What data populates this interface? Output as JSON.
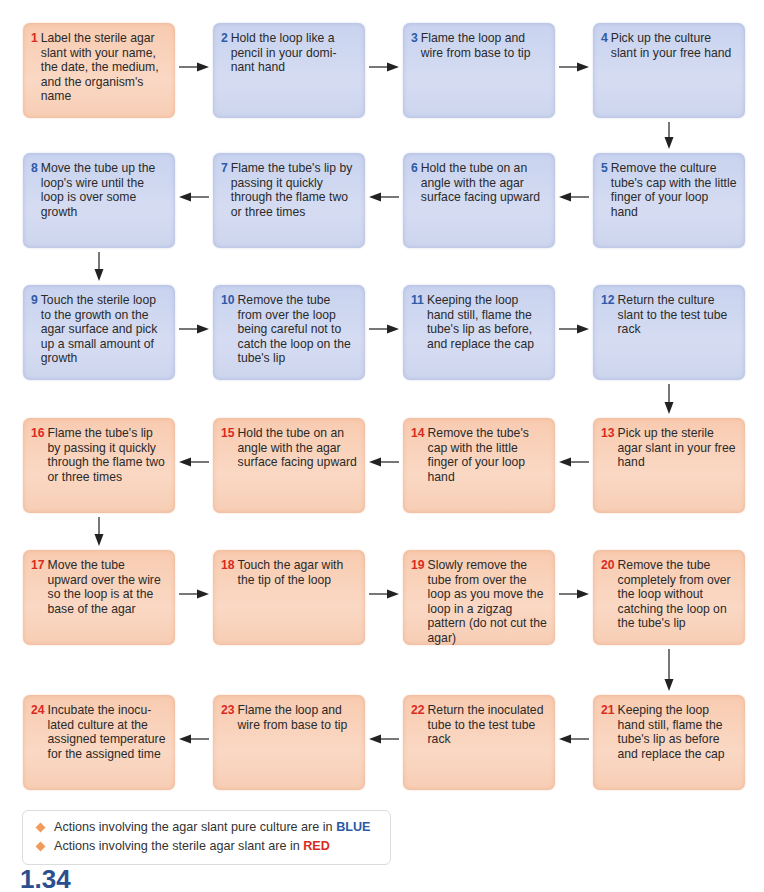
{
  "steps": [
    {
      "n": "1",
      "color": "red",
      "text": "Label the sterile agar slant with your name, the date, the medium, and the organism's name"
    },
    {
      "n": "2",
      "color": "blue",
      "text": "Hold the loop like a pencil in your domi-nant hand"
    },
    {
      "n": "3",
      "color": "blue",
      "text": "Flame the loop and wire from base to tip"
    },
    {
      "n": "4",
      "color": "blue",
      "text": "Pick up the culture slant in your free hand"
    },
    {
      "n": "5",
      "color": "blue",
      "text": "Remove the culture tube's cap with the little finger of your loop hand"
    },
    {
      "n": "6",
      "color": "blue",
      "text": "Hold the tube on an angle with the agar surface facing upward"
    },
    {
      "n": "7",
      "color": "blue",
      "text": "Flame the tube's lip by passing it quickly through the flame two or three times"
    },
    {
      "n": "8",
      "color": "blue",
      "text": "Move the tube up the loop's wire until the loop is over some growth"
    },
    {
      "n": "9",
      "color": "blue",
      "text": "Touch the sterile loop to the growth on the agar surface and pick up a small amount of growth"
    },
    {
      "n": "10",
      "color": "blue",
      "text": "Remove the tube from over the loop being careful not to catch the loop on the tube's lip"
    },
    {
      "n": "11",
      "color": "blue",
      "text": "Keeping the loop hand still, flame the tube's lip as before, and replace the cap"
    },
    {
      "n": "12",
      "color": "blue",
      "text": "Return the culture slant to the test tube rack"
    },
    {
      "n": "13",
      "color": "red",
      "text": "Pick up the sterile agar slant in your free hand"
    },
    {
      "n": "14",
      "color": "red",
      "text": "Remove the tube's cap with the little finger of your loop hand"
    },
    {
      "n": "15",
      "color": "red",
      "text": "Hold the tube on an angle with the agar surface facing upward"
    },
    {
      "n": "16",
      "color": "red",
      "text": "Flame the tube's lip by passing it quickly through the flame two or three times"
    },
    {
      "n": "17",
      "color": "red",
      "text": "Move the tube upward over the wire so the loop is at the base of the agar"
    },
    {
      "n": "18",
      "color": "red",
      "text": "Touch the agar with the tip of the loop"
    },
    {
      "n": "19",
      "color": "red",
      "text": "Slowly remove the tube from over the loop as you move the loop in a zigzag pattern (do not cut the agar)"
    },
    {
      "n": "20",
      "color": "red",
      "text": "Remove the tube completely from over the loop without catching the loop on the tube's lip"
    },
    {
      "n": "21",
      "color": "red",
      "text": "Keeping the loop hand still, flame the tube's lip as before and replace the cap"
    },
    {
      "n": "22",
      "color": "red",
      "text": "Return the inoculated tube to the test tube rack"
    },
    {
      "n": "23",
      "color": "red",
      "text": "Flame the loop and wire from base to tip"
    },
    {
      "n": "24",
      "color": "red",
      "text": "Incubate the inocu-lated culture at the assigned temperature for the assigned time"
    }
  ],
  "legend": {
    "blue_prefix": "Actions involving the agar slant pure culture are in",
    "blue_keyword": "BLUE",
    "red_prefix": "Actions involving the sterile agar slant are in",
    "red_keyword": "RED"
  },
  "figure_label": "1.34",
  "colors": {
    "blue_number": "#2e5aa8",
    "red_number": "#d92b1f",
    "blue_box": "#d0d8f0",
    "red_box": "#f9d2bb",
    "legend_bullet": "#f29a5a"
  }
}
